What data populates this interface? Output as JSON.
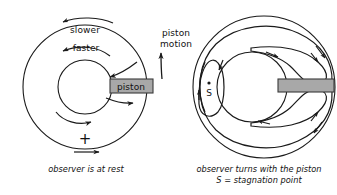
{
  "figure": {
    "title_hidden": "",
    "background_color": "#ffffff",
    "stroke_color": "#1a1a1a",
    "piston_fill_color": "#a8a8a8",
    "piston_stroke_color": "#3a3a3a"
  },
  "left_diagram": {
    "name": "observer-at-rest-diagram",
    "labels": {
      "slower": "slower",
      "faster": "faster",
      "piston": "piston",
      "piston_motion_line1": "piston",
      "piston_motion_line2": "motion",
      "plus": "+"
    },
    "caption": "observer is at rest",
    "geometry": {
      "outer_radius": 62,
      "inner_radius": 27,
      "center_x": 85,
      "center_y": 87
    }
  },
  "right_diagram": {
    "name": "observer-turns-with-piston-diagram",
    "labels": {
      "stagnation_point": "S"
    },
    "caption_line1": "observer turns with the piston",
    "caption_line2": "S = stagnation point",
    "geometry": {
      "outer_radius": 71,
      "inner_radius": 35,
      "center_x": 264,
      "center_y": 87
    }
  }
}
